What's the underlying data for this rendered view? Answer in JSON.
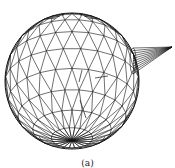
{
  "figure": {
    "caption": "(a)",
    "stroke_color": "#111111",
    "background": "#ffffff",
    "sphere": {
      "cx": 72,
      "cy": 81,
      "rx": 67,
      "ry": 68,
      "pole_x": 72,
      "pole_y": 21,
      "latitude_rings": 10,
      "meridians": 24
    },
    "cone": {
      "base_x": 133,
      "base_top": 48,
      "base_bottom": 74,
      "tip_x": 172,
      "tip_y": 47
    },
    "interior_markers": [
      "arrow-upper",
      "arrow-mid",
      "arrow-lower"
    ]
  }
}
